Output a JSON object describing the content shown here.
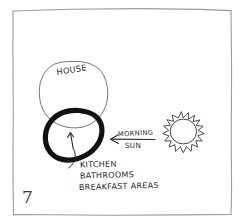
{
  "figure": {
    "page_number": "7",
    "frame": {
      "color": "#9a9a9a"
    },
    "ink_color": "#2b2b2b",
    "bold_ink_color": "#111111",
    "background": "#ffffff"
  },
  "labels": {
    "house": "HOUSE",
    "morning": "MORNING",
    "sun": "SUN",
    "room_list": [
      "KITCHEN",
      "BATHROOMS",
      "BREAKFAST   AREAS"
    ]
  },
  "icons": {
    "sun": "sun-icon",
    "direction_arrow": "left-arrow-icon",
    "callout_arrow": "curved-arrow-icon"
  }
}
